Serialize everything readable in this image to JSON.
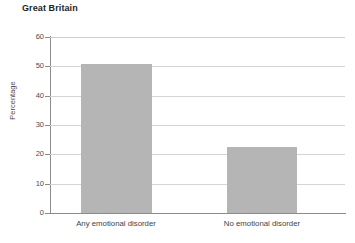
{
  "chart_data": {
    "type": "bar",
    "title": "Great Britain",
    "xlabel": "",
    "ylabel": "Percentage",
    "categories": [
      "Any emotional disorder",
      "No emotional disorder"
    ],
    "values": [
      50.8,
      22.6
    ],
    "ylim": [
      0,
      60
    ],
    "ytick_labels": [
      "0",
      "10",
      "20",
      "30",
      "40",
      "50",
      "60"
    ],
    "ytick_values": [
      0,
      10,
      20,
      30,
      40,
      50,
      60
    ],
    "grid": "horizontal",
    "legend": "none",
    "bar_color": "#b5b5b5",
    "axis_color": "#8b8b8b",
    "gridline_color": "#d4d4d4",
    "title_color": "#231f20",
    "text_color": "#4d4d4d"
  }
}
